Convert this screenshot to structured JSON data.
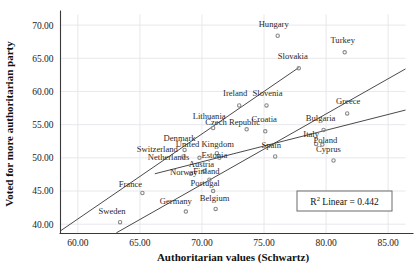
{
  "chart_data": {
    "type": "scatter",
    "title": "",
    "xlabel": "Authoritarian values (Schwartz)",
    "ylabel": "Voted for more authoritarian party",
    "xlim": [
      58.6,
      86.4
    ],
    "ylim": [
      38.6,
      71.6
    ],
    "xticks": [
      "60.00",
      "65.00",
      "70.00",
      "75.00",
      "80.00",
      "85.00"
    ],
    "xtick_values": [
      60,
      65,
      70,
      75,
      80,
      85
    ],
    "yticks": [
      "40.00",
      "45.00",
      "50.00",
      "55.00",
      "60.00",
      "65.00",
      "70.00"
    ],
    "ytick_values": [
      40,
      45,
      50,
      55,
      60,
      65,
      70
    ],
    "grid": true,
    "legend": "none",
    "annotation": {
      "r2_prefix": "R",
      "r2_sup": "2",
      "r2_text": " Linear = 0.442"
    },
    "marker_color": "#8a8a8a",
    "line_color": "#4a4a4a",
    "points": [
      {
        "label": "Hungary",
        "x": 76.1,
        "y": 68.4,
        "lx": -4,
        "ly": -6
      },
      {
        "label": "Turkey",
        "x": 81.5,
        "y": 65.9,
        "lx": -2,
        "ly": -6
      },
      {
        "label": "Slovakia",
        "x": 77.8,
        "y": 63.5,
        "lx": -6,
        "ly": -6
      },
      {
        "label": "Ireland",
        "x": 73.0,
        "y": 57.9,
        "lx": -4,
        "ly": -6
      },
      {
        "label": "Slovenia",
        "x": 75.2,
        "y": 57.9,
        "lx": 1,
        "ly": -6
      },
      {
        "label": "Greece",
        "x": 81.7,
        "y": 56.7,
        "lx": 1,
        "ly": -6
      },
      {
        "label": "Lithuania",
        "x": 70.9,
        "y": 54.5,
        "lx": -4,
        "ly": -6
      },
      {
        "label": "Croatia",
        "x": 75.1,
        "y": 54.0,
        "lx": -1,
        "ly": -6
      },
      {
        "label": "Bulgaria",
        "x": 79.8,
        "y": 54.2,
        "lx": -3,
        "ly": -6
      },
      {
        "label": "Czech Republic",
        "x": 73.6,
        "y": 54.3,
        "lx": -14,
        "ly": -1
      },
      {
        "label": "Italy",
        "x": 79.2,
        "y": 52.1,
        "lx": -5,
        "ly": -4
      },
      {
        "label": "Denmark",
        "x": 68.6,
        "y": 51.2,
        "lx": -5,
        "ly": -6
      },
      {
        "label": "Poland",
        "x": 79.7,
        "y": 52.0,
        "lx": 3,
        "ly": 2
      },
      {
        "label": "United Kingdom",
        "x": 71.2,
        "y": 50.7,
        "lx": -12,
        "ly": -3
      },
      {
        "label": "Spain",
        "x": 75.9,
        "y": 50.2,
        "lx": -4,
        "ly": -5
      },
      {
        "label": "Switzerland",
        "x": 68.5,
        "y": 50.2,
        "lx": -26,
        "ly": -1
      },
      {
        "label": "Estonia",
        "x": 71.4,
        "y": 50.0,
        "lx": -5,
        "ly": 3
      },
      {
        "label": "Cyprus",
        "x": 80.6,
        "y": 49.6,
        "lx": -5,
        "ly": -5
      },
      {
        "label": "Netherlands",
        "x": 69.8,
        "y": 50.0,
        "lx": -31,
        "ly": 5
      },
      {
        "label": "Austria",
        "x": 70.2,
        "y": 48.0,
        "lx": -3,
        "ly": -1
      },
      {
        "label": "Norway",
        "x": 69.1,
        "y": 47.6,
        "lx": -7,
        "ly": 4
      },
      {
        "label": "Finland",
        "x": 70.6,
        "y": 46.7,
        "lx": -3,
        "ly": -3
      },
      {
        "label": "France",
        "x": 65.2,
        "y": 44.7,
        "lx": -12,
        "ly": -3
      },
      {
        "label": "Portugal",
        "x": 70.9,
        "y": 45.0,
        "lx": -8,
        "ly": -2
      },
      {
        "label": "Belgium",
        "x": 71.1,
        "y": 42.3,
        "lx": -1,
        "ly": -5
      },
      {
        "label": "Germany",
        "x": 68.7,
        "y": 41.9,
        "lx": -10,
        "ly": -4
      },
      {
        "label": "Sweden",
        "x": 63.4,
        "y": 40.3,
        "lx": -8,
        "ly": -5
      }
    ],
    "lines": [
      {
        "name": "fit-line-upper",
        "x1": 58.6,
        "y1": 39.0,
        "x2": 77.8,
        "y2": 63.6
      },
      {
        "name": "fit-line-middle",
        "x1": 63.1,
        "y1": 38.7,
        "x2": 86.4,
        "y2": 63.4
      },
      {
        "name": "fit-line-lower",
        "x1": 66.2,
        "y1": 47.6,
        "x2": 86.4,
        "y2": 57.2
      }
    ]
  }
}
